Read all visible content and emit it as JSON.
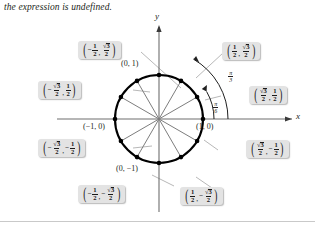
{
  "caption": "the expression is undefined.",
  "figure": {
    "axes": {
      "x_label": "x",
      "y_label": "y"
    },
    "angles": [
      {
        "name": "pi-over-3",
        "num": "π",
        "den": "3",
        "degrees": 60
      },
      {
        "name": "pi-over-6",
        "num": "π",
        "den": "6",
        "degrees": 30
      }
    ],
    "axis_points": [
      {
        "name": "point-0-1",
        "label": "(0, 1)"
      },
      {
        "name": "point-1-0",
        "label": "(1, 0)"
      },
      {
        "name": "point-neg1-0",
        "label": "(−1, 0)"
      },
      {
        "name": "point-0-neg1",
        "label": "(0, −1)"
      }
    ],
    "coordinate_boxes": [
      {
        "name": "coord-120",
        "x_neg": true,
        "x_num": "1",
        "x_den": "2",
        "x_radical": false,
        "y_neg": false,
        "y_num": "3",
        "y_den": "2",
        "y_radical": true,
        "angle_deg": 120
      },
      {
        "name": "coord-60",
        "x_neg": false,
        "x_num": "1",
        "x_den": "2",
        "x_radical": false,
        "y_neg": false,
        "y_num": "3",
        "y_den": "2",
        "y_radical": true,
        "angle_deg": 60
      },
      {
        "name": "coord-150",
        "x_neg": true,
        "x_num": "3",
        "x_den": "2",
        "x_radical": true,
        "y_neg": false,
        "y_num": "1",
        "y_den": "2",
        "y_radical": false,
        "angle_deg": 150
      },
      {
        "name": "coord-30",
        "x_neg": false,
        "x_num": "3",
        "x_den": "2",
        "x_radical": true,
        "y_neg": false,
        "y_num": "1",
        "y_den": "2",
        "y_radical": false,
        "angle_deg": 30
      },
      {
        "name": "coord-210",
        "x_neg": true,
        "x_num": "3",
        "x_den": "2",
        "x_radical": true,
        "y_neg": true,
        "y_num": "1",
        "y_den": "2",
        "y_radical": false,
        "angle_deg": 210
      },
      {
        "name": "coord-330",
        "x_neg": false,
        "x_num": "3",
        "x_den": "2",
        "x_radical": true,
        "y_neg": true,
        "y_num": "1",
        "y_den": "2",
        "y_radical": false,
        "angle_deg": 330
      },
      {
        "name": "coord-240",
        "x_neg": true,
        "x_num": "1",
        "x_den": "2",
        "x_radical": false,
        "y_neg": true,
        "y_num": "3",
        "y_den": "2",
        "y_radical": true,
        "angle_deg": 240
      },
      {
        "name": "coord-300",
        "x_neg": false,
        "x_num": "1",
        "x_den": "2",
        "x_radical": false,
        "y_neg": true,
        "y_num": "3",
        "y_den": "2",
        "y_radical": true,
        "angle_deg": 300
      }
    ],
    "circle": {
      "center_x": 159,
      "center_y": 119,
      "radius": 44,
      "marked_angles_deg": [
        0,
        30,
        60,
        90,
        120,
        150,
        180,
        210,
        240,
        270,
        300,
        330
      ]
    },
    "colors": {
      "box_fill": "#e3e3e3",
      "circle_stroke": "#000000",
      "spoke_stroke": "#7a7a7a",
      "leader_stroke": "#b0b0b0",
      "axis_stroke": "#6e6e6e",
      "text": "#231f20"
    }
  }
}
